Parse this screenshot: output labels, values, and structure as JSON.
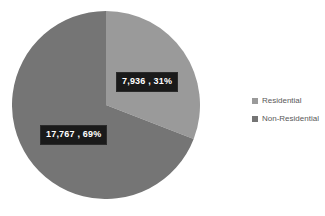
{
  "chart_data": {
    "type": "pie",
    "title": "",
    "labels": [
      "Residential",
      "Non-Residential"
    ],
    "values": [
      7936,
      17767
    ],
    "percentages": [
      31,
      69
    ],
    "value_labels": [
      "7,936 , 31%",
      "17,767 , 69%"
    ],
    "colors": [
      "#9a9a9a",
      "#757575"
    ],
    "total": 25703,
    "start_angle_deg": 0,
    "direction": "clockwise",
    "legend": {
      "position": "right",
      "entries": [
        {
          "label": "Residential",
          "color": "#9a9a9a"
        },
        {
          "label": "Non-Residential",
          "color": "#757575"
        }
      ]
    },
    "data_label_style": {
      "background": "#1a1a1a",
      "text_color": "#ffffff"
    },
    "background": "#ffffff"
  },
  "slices": [
    {
      "name": "Residential",
      "value": 7936,
      "percent": 31,
      "label_text": "7,936 , 31%",
      "color": "#9a9a9a"
    },
    {
      "name": "Non-Residential",
      "value": 17767,
      "percent": 69,
      "label_text": "17,767 , 69%",
      "color": "#757575"
    }
  ]
}
